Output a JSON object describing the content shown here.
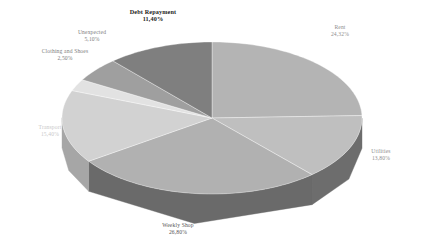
{
  "chart_data": {
    "type": "pie",
    "title": "",
    "subtitle": "",
    "xlabel": "",
    "ylabel": "",
    "three_d": true,
    "legend_position": "none",
    "labels_outside": true,
    "start_angle_deg": 0,
    "direction": "clockwise",
    "background": "#ffffff",
    "categories": [
      "Rent",
      "Utilities",
      "Weekly Shop",
      "Transport",
      "Clothing and Shoes",
      "Unexpected",
      "Debt Repayment"
    ],
    "values": [
      24.32,
      13.8,
      26.8,
      15.4,
      2.5,
      5.1,
      11.4
    ],
    "value_suffix": "%",
    "slices": [
      {
        "name": "Rent",
        "pct_text": "24,32%",
        "value": 24.32,
        "top_color": "#b4b4b4",
        "side_color": "#8f8f8f",
        "label_color": "#8e8e8e",
        "label_weight": "normal"
      },
      {
        "name": "Utilities",
        "pct_text": "13,80%",
        "value": 13.8,
        "top_color": "#bfbfbf",
        "side_color": "#6d6d6d",
        "label_color": "#9a9a9a",
        "label_weight": "normal"
      },
      {
        "name": "Weekly Shop",
        "pct_text": "26,80%",
        "value": 26.8,
        "top_color": "#b1b1b1",
        "side_color": "#6a6a6a",
        "label_color": "#4f4f4f",
        "label_weight": "normal"
      },
      {
        "name": "Transport",
        "pct_text": "15,40%",
        "value": 15.4,
        "top_color": "#d2d2d2",
        "side_color": "#a6a6a6",
        "label_color": "#c9c9c9",
        "label_weight": "normal"
      },
      {
        "name": "Clothing and Shoes",
        "pct_text": "2,50%",
        "value": 2.5,
        "top_color": "#e2e2e2",
        "side_color": "#b8b8b8",
        "label_color": "#6f6f6f",
        "label_weight": "normal"
      },
      {
        "name": "Unexpected",
        "pct_text": "5,10%",
        "value": 5.1,
        "top_color": "#9f9f9f",
        "side_color": "#7d7d7d",
        "label_color": "#9e9e9e",
        "label_weight": "normal"
      },
      {
        "name": "Debt Repayment",
        "pct_text": "11,40%",
        "value": 11.4,
        "top_color": "#7f7f7f",
        "side_color": "#5e5e5e",
        "label_color": "#1c1c1c",
        "label_weight": "bold"
      }
    ]
  },
  "labels": {
    "debt_repayment": {
      "name": "Debt Repayment",
      "pct": "11,40%"
    },
    "rent": {
      "name": "Rent",
      "pct": "24,32%"
    },
    "utilities": {
      "name": "Utilities",
      "pct": "13,80%"
    },
    "weekly_shop": {
      "name": "Weekly Shop",
      "pct": "26,80%"
    },
    "transport": {
      "name": "Transport",
      "pct": "15,40%"
    },
    "clothing_and_shoes": {
      "name": "Clothing and Shoes",
      "pct": "2,50%"
    },
    "unexpected": {
      "name": "Unexpected",
      "pct": "5,10%"
    }
  }
}
